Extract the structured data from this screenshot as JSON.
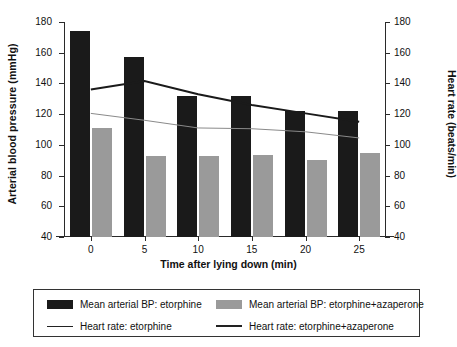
{
  "chart_data": {
    "type": "bar",
    "title": "",
    "xlabel": "Time after lying down (min)",
    "ylabel": "Arterial blood pressure (mmHg)",
    "ylabel_secondary": "Heart rate (beats/min)",
    "categories": [
      "0",
      "5",
      "10",
      "15",
      "20",
      "25"
    ],
    "ylim": [
      40,
      180
    ],
    "yticks": [
      "180",
      "160",
      "140",
      "120",
      "100",
      "80",
      "60",
      "40"
    ],
    "ylim_secondary": [
      40,
      180
    ],
    "yticks_secondary": [
      "180",
      "160",
      "140",
      "120",
      "100",
      "80",
      "60",
      "40"
    ],
    "grid": false,
    "legend_position": "below",
    "series": [
      {
        "name": "Mean arterial BP: etorphine",
        "kind": "bar",
        "axis": "left",
        "color": "#1a1a1a",
        "values": [
          174,
          157.5,
          131.5,
          131.5,
          122,
          122
        ]
      },
      {
        "name": "Mean arterial BP: etorphine+azaperone",
        "kind": "bar",
        "axis": "left",
        "color": "#9a9a9a",
        "values": [
          111,
          93,
          92.5,
          93.5,
          90,
          95
        ]
      },
      {
        "name": "Heart rate: etorphine",
        "kind": "line",
        "axis": "right",
        "color": "#8a8a8a",
        "linewidth": 1,
        "values": [
          120.5,
          116,
          111,
          110.5,
          108.5,
          104.5
        ]
      },
      {
        "name": "Heart rate: etorphine+azaperone",
        "kind": "line",
        "axis": "right",
        "color": "#1a1a1a",
        "linewidth": 2,
        "values": [
          136,
          141.5,
          133,
          126,
          120.5,
          115
        ]
      }
    ]
  },
  "axes": {
    "left_title": "Arterial blood pressure (mmHg)",
    "right_title": "Heart rate (beats/min)",
    "x_title": "Time after lying down (min)"
  },
  "legend": {
    "items": [
      {
        "label": "Mean arterial BP: etorphine",
        "marker": "swatch-dark"
      },
      {
        "label": "Mean arterial BP: etorphine+azaperone",
        "marker": "swatch-gray"
      },
      {
        "label": "Heart rate: etorphine",
        "marker": "line-thin"
      },
      {
        "label": "Heart rate: etorphine+azaperone",
        "marker": "line-thick"
      }
    ]
  },
  "colors": {
    "bar_dark": "#1a1a1a",
    "bar_gray": "#9a9a9a",
    "line_dark": "#1a1a1a",
    "line_gray": "#8a8a8a",
    "axis": "#2a2a2a",
    "background": "#ffffff"
  }
}
